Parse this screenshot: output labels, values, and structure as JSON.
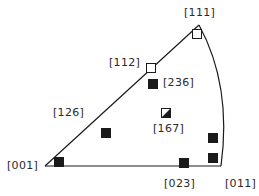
{
  "diagram": {
    "type": "stereographic-triangle",
    "stroke_color": "#1a1a1a",
    "vertices": {
      "v001": {
        "label": "[001]",
        "x": 45,
        "y": 166
      },
      "v111": {
        "label": "[111]",
        "x": 199,
        "y": 25
      },
      "v011": {
        "label": "[011]",
        "x": 221,
        "y": 166
      }
    },
    "labels": [
      {
        "id": "label-111",
        "text": "[111]",
        "x": 184,
        "y": 7
      },
      {
        "id": "label-112",
        "text": "[112]",
        "x": 109,
        "y": 57
      },
      {
        "id": "label-236",
        "text": "[236]",
        "x": 163,
        "y": 77
      },
      {
        "id": "label-126",
        "text": "[126]",
        "x": 53,
        "y": 107
      },
      {
        "id": "label-167",
        "text": "[167]",
        "x": 153,
        "y": 123
      },
      {
        "id": "label-001",
        "text": "[001]",
        "x": 7,
        "y": 160
      },
      {
        "id": "label-023",
        "text": "[023]",
        "x": 164,
        "y": 178
      },
      {
        "id": "label-011",
        "text": "[011]",
        "x": 225,
        "y": 178
      }
    ],
    "markers": [
      {
        "id": "marker-111",
        "fill": "open",
        "x": 197,
        "y": 34
      },
      {
        "id": "marker-112",
        "fill": "open",
        "x": 151,
        "y": 68
      },
      {
        "id": "marker-236",
        "fill": "filled",
        "x": 153,
        "y": 84
      },
      {
        "id": "marker-167",
        "fill": "half",
        "x": 166,
        "y": 113
      },
      {
        "id": "marker-126-region",
        "fill": "filled",
        "x": 106,
        "y": 133
      },
      {
        "id": "marker-001",
        "fill": "filled",
        "x": 59,
        "y": 162
      },
      {
        "id": "marker-023",
        "fill": "filled",
        "x": 184,
        "y": 163
      },
      {
        "id": "marker-right-upper",
        "fill": "filled",
        "x": 213,
        "y": 138
      },
      {
        "id": "marker-right-lower",
        "fill": "filled",
        "x": 213,
        "y": 158
      }
    ],
    "marker_size": 9
  }
}
